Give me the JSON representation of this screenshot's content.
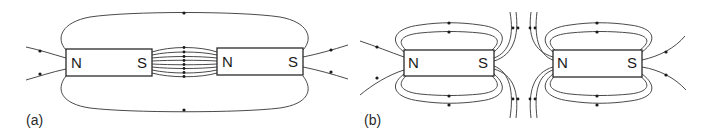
{
  "figure": {
    "panels": [
      {
        "id": "a",
        "label": "(a)",
        "arrangement": "attracting (N-S facing S-N, unlike poles facing)",
        "magnets": [
          {
            "left_pole": "N",
            "right_pole": "S"
          },
          {
            "left_pole": "N",
            "right_pole": "S"
          }
        ]
      },
      {
        "id": "b",
        "label": "(b)",
        "arrangement": "repelling (S facing N... like-pole field lines diverging between magnets)",
        "magnets": [
          {
            "left_pole": "N",
            "right_pole": "S"
          },
          {
            "left_pole": "N",
            "right_pole": "S"
          }
        ]
      }
    ]
  },
  "colors": {
    "line": "#4a4a4a",
    "magnet_border": "#2a2a2a",
    "background": "#ffffff"
  }
}
